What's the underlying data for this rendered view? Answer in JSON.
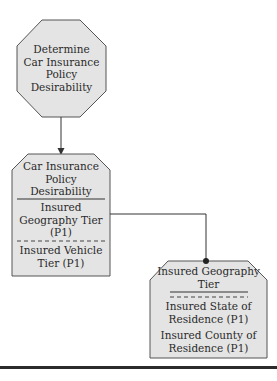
{
  "colors": {
    "shape_fill": "#e4e4e4",
    "shape_stroke": "#555555",
    "connector": "#333333"
  },
  "nodes": {
    "decision": {
      "lines": [
        "Determine",
        "Car Insurance",
        "Policy",
        "Desirability"
      ]
    },
    "policy_desirability": {
      "title_lines": [
        "Car Insurance",
        "Policy",
        "Desirability"
      ],
      "section1_lines": [
        "Insured",
        "Geography Tier",
        "(P1)"
      ],
      "section2_lines": [
        "Insured Vehicle",
        "Tier (P1)"
      ]
    },
    "geography_tier": {
      "title_lines": [
        "Insured Geography",
        "Tier"
      ],
      "section1_lines": [
        "Insured State of",
        "Residence (P1)"
      ],
      "section2_lines": [
        "Insured County of",
        "Residence (P1)"
      ]
    }
  }
}
